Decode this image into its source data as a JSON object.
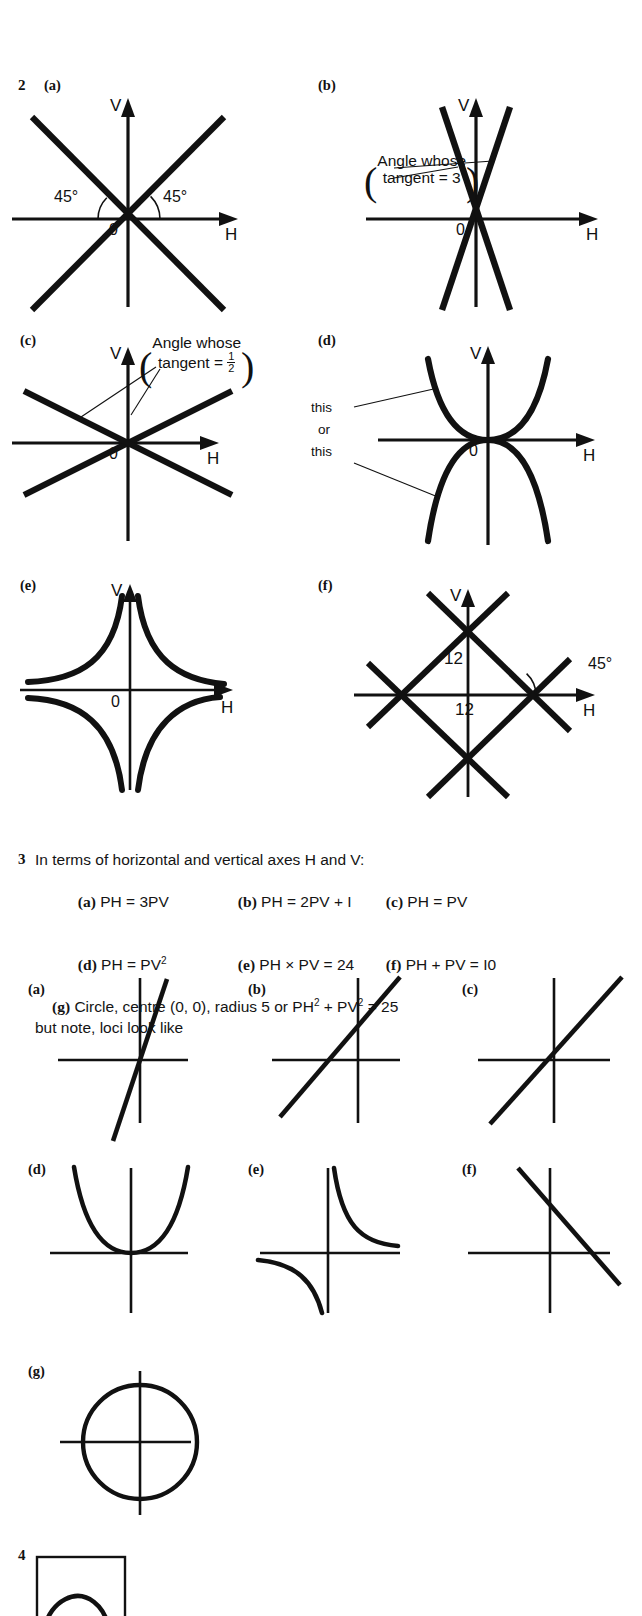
{
  "page": {
    "width": 642,
    "height": 1610,
    "background": "#ffffff",
    "ink": "#111111"
  },
  "item2": {
    "number": "2",
    "panels": [
      {
        "label": "(a)",
        "v_axis_label": "V",
        "h_axis_label": "H",
        "origin_label": "0",
        "annotations": [
          "45°",
          "45°"
        ],
        "shape": "two straight lines through origin at +45° and -45°"
      },
      {
        "label": "(b)",
        "v_axis_label": "V",
        "h_axis_label": "H",
        "origin_label": "0",
        "callout_line1": "Angle whose",
        "callout_line2": "tangent = 3",
        "shape": "two steep straight lines through origin, gradient ±3"
      },
      {
        "label": "(c)",
        "v_axis_label": "V",
        "h_axis_label": "H",
        "origin_label": "0",
        "callout_line1": "Angle whose",
        "callout_line2_prefix": "tangent =",
        "callout_fraction_numerator": "1",
        "callout_fraction_denominator": "2",
        "shape": "two shallow straight lines through origin, gradient ±½"
      },
      {
        "label": "(d)",
        "v_axis_label": "V",
        "h_axis_label": "H",
        "origin_label": "0",
        "annotations": [
          "this",
          "or",
          "this"
        ],
        "shape": "parabola opening upward and parabola opening downward, vertex at origin"
      },
      {
        "label": "(e)",
        "v_axis_label": "V",
        "h_axis_label": "H",
        "origin_label": "0",
        "shape": "rectangular hyperbola branches in all four quadrants asymptotic to both axes"
      },
      {
        "label": "(f)",
        "v_axis_label": "V",
        "h_axis_label": "H",
        "annotations": [
          "12",
          "12",
          "45°"
        ],
        "shape": "square (diamond) of four straight lines with intercepts 12 on each axis"
      }
    ]
  },
  "item3": {
    "number": "3",
    "intro": "In terms of horizontal and vertical axes H and V:",
    "answers": [
      {
        "label": "(a)",
        "text": "PH = 3PV"
      },
      {
        "label": "(b)",
        "text": "PH = 2PV + I"
      },
      {
        "label": "(c)",
        "text": "PH = PV"
      },
      {
        "label": "(d)",
        "text_before_sup": "PH = PV",
        "sup": "2"
      },
      {
        "label": "(e)",
        "text": "PH × PV = 24"
      },
      {
        "label": "(f)",
        "text": "PH + PV = I0"
      }
    ],
    "answer_g": {
      "label": "(g)",
      "part1": "Circle, centre (0, 0), radius 5 or PH",
      "sup1": "2",
      "part2": " + PV",
      "sup2": "2",
      "part3": " = 25"
    },
    "note": "but note, loci look like",
    "loci_panels": [
      {
        "label": "(a)",
        "shape": "steep straight line through origin, positive gradient 3"
      },
      {
        "label": "(b)",
        "shape": "straight line positive gradient, positive V-intercept"
      },
      {
        "label": "(c)",
        "shape": "straight line through origin at 45°"
      },
      {
        "label": "(d)",
        "shape": "upward parabola with vertex at origin"
      },
      {
        "label": "(e)",
        "shape": "rectangular hyperbola, branches in first and third quadrants"
      },
      {
        "label": "(f)",
        "shape": "straight line, negative gradient, positive intercepts"
      },
      {
        "label": "(g)",
        "shape": "circle centred on origin"
      }
    ]
  },
  "item4": {
    "number": "4",
    "shape": "square frame containing an arc"
  }
}
